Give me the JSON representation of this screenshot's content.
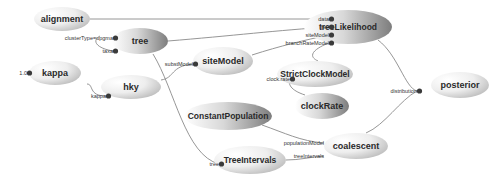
{
  "diagram": {
    "nodes": [
      {
        "id": "alignment",
        "label": "alignment",
        "cx": 62,
        "cy": 19,
        "rx": 28,
        "ry": 12,
        "grad": "gL"
      },
      {
        "id": "tree",
        "label": "tree",
        "cx": 140,
        "cy": 41,
        "rx": 28,
        "ry": 13,
        "grad": "gR"
      },
      {
        "id": "kappa",
        "label": "kappa",
        "cx": 55,
        "cy": 73,
        "rx": 26,
        "ry": 12,
        "grad": "gL"
      },
      {
        "id": "hky",
        "label": "hky",
        "cx": 131,
        "cy": 87,
        "rx": 30,
        "ry": 12,
        "grad": "gL"
      },
      {
        "id": "siteModel",
        "label": "siteModel",
        "cx": 223,
        "cy": 61,
        "rx": 30,
        "ry": 14,
        "grad": "gL"
      },
      {
        "id": "treeLikelihood",
        "label": "treeLikelihood",
        "cx": 348,
        "cy": 27,
        "rx": 44,
        "ry": 17,
        "grad": "gR"
      },
      {
        "id": "StrictClockModel",
        "label": "StrictClockModel",
        "cx": 315,
        "cy": 74,
        "rx": 38,
        "ry": 13,
        "grad": "gL"
      },
      {
        "id": "clockRate",
        "label": "clockRate",
        "cx": 322,
        "cy": 106,
        "rx": 27,
        "ry": 13,
        "grad": "gR"
      },
      {
        "id": "posterior",
        "label": "posterior",
        "cx": 460,
        "cy": 85,
        "rx": 29,
        "ry": 13,
        "grad": "gL"
      },
      {
        "id": "ConstantPopulation",
        "label": "ConstantPopulation",
        "cx": 228,
        "cy": 116,
        "rx": 44,
        "ry": 14,
        "grad": "gR"
      },
      {
        "id": "coalescent",
        "label": "coalescent",
        "cx": 356,
        "cy": 146,
        "rx": 32,
        "ry": 13,
        "grad": "gL"
      },
      {
        "id": "TreeIntervals",
        "label": "TreeIntervals",
        "cx": 250,
        "cy": 160,
        "rx": 36,
        "ry": 14,
        "grad": "gL"
      }
    ],
    "ports": [
      {
        "id": "tree-clusterType",
        "label": "clusterType=upgma",
        "x": 113,
        "y": 38,
        "anchor": "end",
        "dot": true
      },
      {
        "id": "tree-taxa",
        "label": "taxa",
        "x": 113,
        "y": 51,
        "anchor": "end",
        "dot": true
      },
      {
        "id": "kappa-value",
        "label": "1.0",
        "x": 27,
        "y": 73,
        "anchor": "end",
        "dot": true
      },
      {
        "id": "hky-kappa",
        "label": "kappa",
        "x": 106,
        "y": 96,
        "anchor": "end",
        "dot": true
      },
      {
        "id": "siteModel-substModel",
        "label": "substModel",
        "x": 193,
        "y": 64,
        "anchor": "end",
        "dot": true
      },
      {
        "id": "tl-data",
        "label": "data",
        "x": 329,
        "y": 19,
        "anchor": "end",
        "dot": true
      },
      {
        "id": "tl-tree",
        "label": "tree",
        "x": 329,
        "y": 27,
        "anchor": "end",
        "dot": true
      },
      {
        "id": "tl-siteModel",
        "label": "siteModel",
        "x": 329,
        "y": 35,
        "anchor": "end",
        "dot": true
      },
      {
        "id": "tl-branchRateModel",
        "label": "branchRateModel",
        "x": 329,
        "y": 43,
        "anchor": "end",
        "dot": true
      },
      {
        "id": "scm-clockrate",
        "label": "clock.rate",
        "x": 290,
        "y": 79,
        "anchor": "end",
        "dot": true
      },
      {
        "id": "posterior-distribution",
        "label": "distribution",
        "x": 417,
        "y": 91,
        "anchor": "end",
        "dot": true
      },
      {
        "id": "coal-populationModel",
        "label": "populationModel",
        "x": 324,
        "y": 143,
        "anchor": "end",
        "dot": false
      },
      {
        "id": "coal-treeIntervals",
        "label": "treeIntervals",
        "x": 324,
        "y": 156,
        "anchor": "end",
        "dot": false
      },
      {
        "id": "ti-tree",
        "label": "tree",
        "x": 219,
        "y": 164,
        "anchor": "end",
        "dot": true
      }
    ],
    "edges": [
      {
        "from": "alignment",
        "to": "tl-data",
        "d": "M90,19 L329,19"
      },
      {
        "from": "tree",
        "to": "tl-tree",
        "d": "M168,41 C230,36 280,30 329,27"
      },
      {
        "from": "siteModel",
        "to": "tl-siteModel",
        "d": "M252,55 C280,46 305,40 329,35"
      },
      {
        "from": "StrictClockModel",
        "to": "tl-branchRateModel",
        "d": "M318,61 C305,55 318,47 329,43"
      },
      {
        "from": "hky",
        "to": "siteModel-substModel",
        "d": "M161,80 C175,78 170,66 193,64"
      },
      {
        "from": "kappa",
        "to": "hky-kappa",
        "d": "M87,84 C94,84 88,96 106,96"
      },
      {
        "from": "tree",
        "to": "tree-clusterType",
        "d": "M100,36 C92,40 95,48 113,51"
      },
      {
        "from": "tree",
        "to": "ti-tree",
        "d": "M153,54 C175,90 185,155 219,164"
      },
      {
        "from": "clockRate",
        "to": "scm-clockrate",
        "d": "M305,95 C290,90 288,84 290,79"
      },
      {
        "from": "treeLikelihood",
        "to": "posterior-distribution",
        "d": "M378,40 C398,55 405,88 417,91"
      },
      {
        "from": "coalescent",
        "to": "posterior-distribution",
        "d": "M366,133 C385,125 400,100 417,91"
      },
      {
        "from": "ConstantPopulation",
        "to": "coal-populationModel",
        "d": "M262,125 C285,133 300,141 324,143"
      },
      {
        "from": "TreeIntervals",
        "to": "coal-treeIntervals",
        "d": "M286,160 C300,160 310,157 324,156"
      }
    ]
  }
}
